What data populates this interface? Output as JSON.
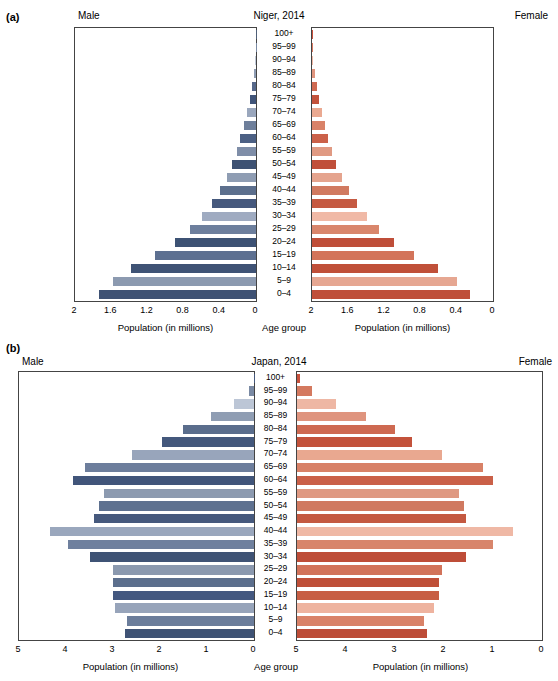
{
  "panels": [
    {
      "label": "(a)"
    },
    {
      "label": "(b)"
    }
  ],
  "common": {
    "male_label": "Male",
    "female_label": "Female",
    "age_group_label": "Age group",
    "axis_title": "Population (in millions)"
  },
  "chart_data": [
    {
      "type": "bar",
      "orientation": "population-pyramid",
      "title": "Niger, 2014",
      "xlabel": "Population (in millions)",
      "ylabel": "Age group",
      "xlim": [
        0,
        2
      ],
      "ticks": [
        "2",
        "1.6",
        "1.2",
        "0.8",
        "0.4",
        "0"
      ],
      "tick_values": [
        2,
        1.6,
        1.2,
        0.8,
        0.4,
        0
      ],
      "categories": [
        "100+",
        "95–99",
        "90–94",
        "85–89",
        "80–84",
        "75–79",
        "70–74",
        "65–69",
        "60–64",
        "55–59",
        "50–54",
        "45–49",
        "40–44",
        "35–39",
        "30–34",
        "25–29",
        "20–24",
        "15–19",
        "10–14",
        "5–9",
        "0–4"
      ],
      "series": [
        {
          "name": "Male",
          "values": [
            0.002,
            0.005,
            0.012,
            0.025,
            0.045,
            0.07,
            0.1,
            0.135,
            0.175,
            0.215,
            0.265,
            0.325,
            0.4,
            0.49,
            0.6,
            0.73,
            0.9,
            1.12,
            1.38,
            1.58,
            1.73
          ]
        },
        {
          "name": "Female",
          "values": [
            0.002,
            0.006,
            0.014,
            0.028,
            0.05,
            0.075,
            0.105,
            0.14,
            0.18,
            0.22,
            0.27,
            0.33,
            0.405,
            0.495,
            0.61,
            0.74,
            0.91,
            1.13,
            1.39,
            1.6,
            1.75
          ]
        }
      ],
      "male_colors": [
        "#4f5f78",
        "#7b8ba4",
        "#c3ccdb",
        "#8e9cb3",
        "#56688a",
        "#41557a",
        "#9aa7bd",
        "#6e7f9b",
        "#4c6084",
        "#7f8ea8",
        "#3e5273",
        "#8f9db3",
        "#5c6f8d",
        "#46597d",
        "#9fabc1",
        "#6d7f9d",
        "#3d5274",
        "#5d7091",
        "#3f5375",
        "#8c9ab0",
        "#3f5274"
      ],
      "female_colors": [
        "#c9523e",
        "#d97a63",
        "#efb8a5",
        "#e0957f",
        "#cf6a52",
        "#c4533c",
        "#eaa991",
        "#d98268",
        "#cb6149",
        "#e09a83",
        "#c04f3a",
        "#e5a48e",
        "#d17a60",
        "#c55a42",
        "#f0b9a6",
        "#d9866c",
        "#bf4e39",
        "#d3745a",
        "#c05039",
        "#e6a792",
        "#bf4f3a"
      ]
    },
    {
      "type": "bar",
      "orientation": "population-pyramid",
      "title": "Japan, 2014",
      "xlabel": "Population (in millions)",
      "ylabel": "Age group",
      "xlim": [
        0,
        5
      ],
      "ticks": [
        "5",
        "4",
        "3",
        "2",
        "1",
        "0"
      ],
      "tick_values": [
        5,
        4,
        3,
        2,
        1,
        0
      ],
      "categories": [
        "100+",
        "95–99",
        "90–94",
        "85–89",
        "80–84",
        "75–79",
        "70–74",
        "65–69",
        "60–64",
        "55–59",
        "50–54",
        "45–49",
        "40–44",
        "35–39",
        "30–34",
        "25–29",
        "20–24",
        "15–19",
        "10–14",
        "5–9",
        "0–4"
      ],
      "series": [
        {
          "name": "Male",
          "values": [
            0.01,
            0.1,
            0.42,
            0.92,
            1.52,
            1.95,
            2.6,
            3.6,
            3.85,
            3.2,
            3.3,
            3.4,
            4.35,
            3.95,
            3.5,
            3.0,
            3.0,
            3.0,
            2.95,
            2.7,
            2.75
          ]
        },
        {
          "name": "Female",
          "values": [
            0.07,
            0.3,
            0.8,
            1.4,
            2.0,
            2.35,
            2.95,
            3.8,
            4.0,
            3.3,
            3.4,
            3.45,
            4.4,
            4.0,
            3.45,
            2.95,
            2.9,
            2.9,
            2.8,
            2.6,
            2.65
          ]
        }
      ],
      "male_colors": [
        "#46597d",
        "#7a8aa4",
        "#bcc6d6",
        "#8f9db3",
        "#5a6d8c",
        "#44587c",
        "#98a5bb",
        "#6d7e9c",
        "#41557a",
        "#8c9ab0",
        "#5e7190",
        "#46597d",
        "#9aa7bd",
        "#6f809e",
        "#3f5375",
        "#8b99af",
        "#5c6f8d",
        "#445880",
        "#97a4ba",
        "#6b7d9b",
        "#3f5375"
      ],
      "female_colors": [
        "#c8523d",
        "#d4795f",
        "#eeb7a4",
        "#df947e",
        "#ce6951",
        "#c3523b",
        "#e9a890",
        "#d88167",
        "#ca6048",
        "#df9982",
        "#d07960",
        "#c45941",
        "#efb8a5",
        "#d8856b",
        "#be4d38",
        "#d2735a",
        "#bf4f38",
        "#c75e44",
        "#eeb39f",
        "#d98268",
        "#bd4c37"
      ]
    }
  ]
}
